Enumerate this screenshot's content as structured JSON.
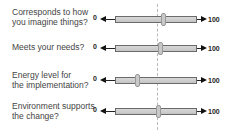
{
  "scale": {
    "min_label": "0",
    "max_label": "100",
    "reference_line_value": 52
  },
  "rows": [
    {
      "question_line1": "Corresponds to how",
      "question_line2": "you imagine things?",
      "value": 58
    },
    {
      "question_line1": "Meets your needs?",
      "question_line2": "",
      "value": 55
    },
    {
      "question_line1": "Energy level for",
      "question_line2": "the implementation?",
      "value": 27
    },
    {
      "question_line1": "Environment supports",
      "question_line2": "the change?",
      "value": 52
    }
  ],
  "colors": {
    "bar": "#cccccc",
    "bar_border": "#6a6a6a",
    "handle": "#c8c8c8",
    "text": "#444444",
    "reference_line": "#b8b8b8"
  }
}
